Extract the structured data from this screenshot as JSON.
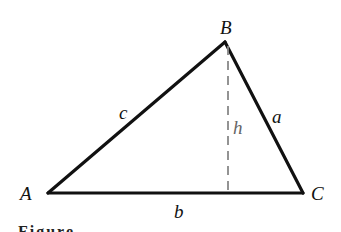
{
  "diagram": {
    "vertices": [
      {
        "name": "A",
        "x": 48,
        "y": 193,
        "label_x": 20,
        "label_y": 184
      },
      {
        "name": "B",
        "x": 225,
        "y": 42,
        "label_x": 220,
        "label_y": 18
      },
      {
        "name": "C",
        "x": 303,
        "y": 193,
        "label_x": 311,
        "label_y": 184
      }
    ],
    "sides": [
      {
        "name": "c",
        "from": "A",
        "to": "B",
        "label_x": 119,
        "label_y": 103
      },
      {
        "name": "a",
        "from": "B",
        "to": "C",
        "label_x": 272,
        "label_y": 107
      },
      {
        "name": "b",
        "from": "A",
        "to": "C",
        "label_x": 174,
        "label_y": 202
      }
    ],
    "altitude": {
      "name": "h",
      "from": "B",
      "foot_x": 228,
      "foot_y": 193,
      "label_x": 233,
      "label_y": 118,
      "style": "dashed"
    },
    "colors": {
      "line": "#111111",
      "altitude": "#888888",
      "h_label": "#666666"
    },
    "caption_partial": "Figure"
  }
}
